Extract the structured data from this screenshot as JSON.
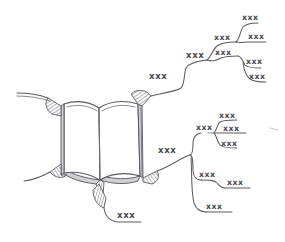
{
  "diagram": {
    "type": "mind-map",
    "background_color": "#ffffff",
    "ink_color": "#5d5d63",
    "label_color": "#4a4a50",
    "shading_color": "#cfcfd4",
    "center": {
      "name": "open-book",
      "description": "open book illustration"
    },
    "branches": {
      "upper_right": {
        "stem_label": "xxx",
        "node_a_label": "xxx",
        "node_b_label": "xxx",
        "node_c_label": "xxx",
        "leaves": [
          {
            "label": "xxx"
          },
          {
            "label": "xxx"
          },
          {
            "label": "xxx"
          },
          {
            "label": "xxx"
          }
        ]
      },
      "lower_right": {
        "stem_label": "xxx",
        "sub_a_label": "xxx",
        "sub_a_leaves": [
          {
            "label": "xxx"
          },
          {
            "label": "xxx"
          },
          {
            "label": "xxx"
          }
        ],
        "sub_b_label": "xxx",
        "sub_b_leaves": [
          {
            "label": "xxx"
          }
        ],
        "sub_c_label": "xxx"
      },
      "bottom": {
        "label": "xxx"
      },
      "upper_left": {
        "label": ""
      },
      "lower_left": {
        "label": ""
      }
    }
  }
}
